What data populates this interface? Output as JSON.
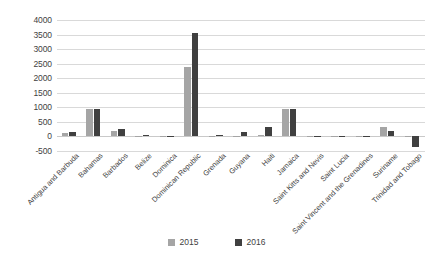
{
  "chart_data": {
    "type": "bar",
    "title": "",
    "xlabel": "",
    "ylabel": "",
    "ylim": [
      -500,
      4000
    ],
    "ytick_step": 500,
    "yticks": [
      4000,
      3500,
      3000,
      2500,
      2000,
      1500,
      1000,
      500,
      0,
      -500
    ],
    "ytick_labels": [
      "4000",
      "3500",
      "3000",
      "2500",
      "2000",
      "1500",
      "1000",
      "500",
      "0",
      "-500"
    ],
    "grid": true,
    "legend_position": "bottom-center",
    "categories": [
      "Antigua and Barbuda",
      "Bahamas",
      "Barbados",
      "Belize",
      "Dominica",
      "Dominican Republic",
      "Grenada",
      "Guyana",
      "Haiti",
      "Jamaica",
      "Saint Kitts and Nevis",
      "Saint Lucia",
      "Saint Vincent and the Grenadines",
      "Suriname",
      "Trinidad and Tobago"
    ],
    "series": [
      {
        "name": "2015",
        "color": "#a5a5a5",
        "values": [
          130,
          940,
          200,
          20,
          10,
          2400,
          10,
          20,
          55,
          950,
          15,
          20,
          20,
          330,
          10
        ]
      },
      {
        "name": "2016",
        "color": "#404040",
        "values": [
          150,
          935,
          270,
          35,
          15,
          3550,
          60,
          145,
          320,
          950,
          20,
          25,
          25,
          175,
          -350
        ]
      }
    ]
  },
  "legend": {
    "items": [
      {
        "label": "2015",
        "color": "#a5a5a5"
      },
      {
        "label": "2016",
        "color": "#404040"
      }
    ]
  },
  "colors": {
    "series_2015": "#a5a5a5",
    "series_2016": "#404040",
    "gridline": "#d9d9d9",
    "text": "#3f3f3f",
    "background": "#ffffff"
  }
}
